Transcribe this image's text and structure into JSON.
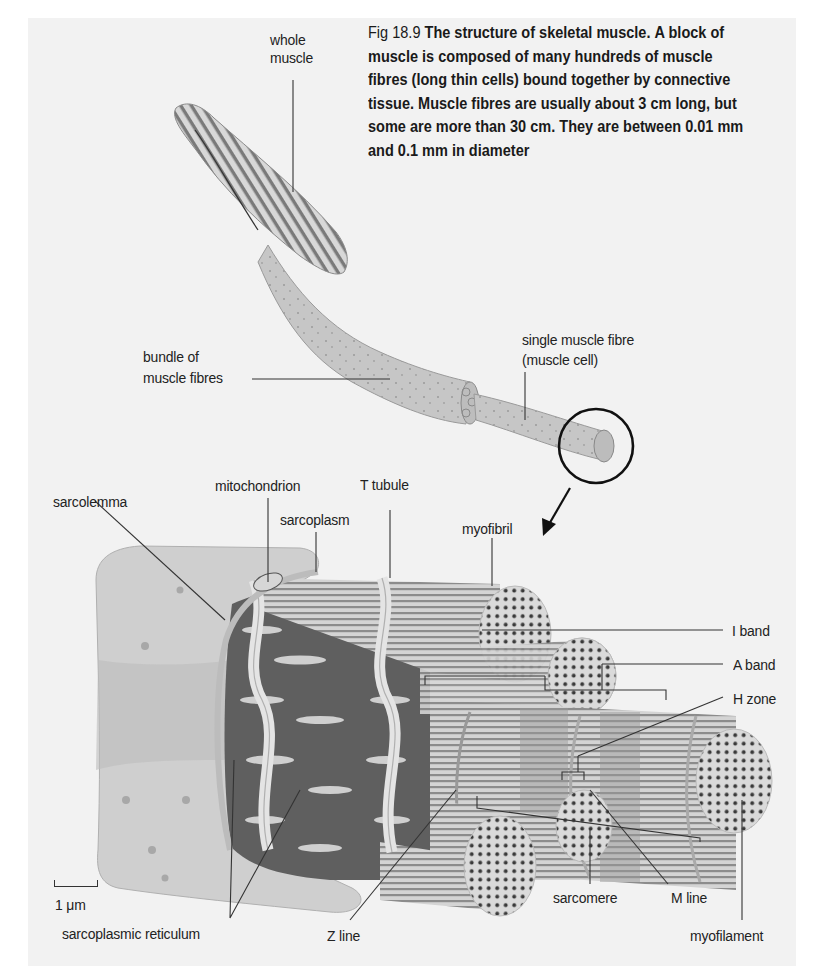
{
  "caption": {
    "figure_number": "Fig 18.9",
    "title": "The structure of skeletal muscle.",
    "body": "A block of muscle is composed of many hundreds of muscle fibres (long thin cells) bound together by connective tissue. Muscle fibres are usually about 3 cm long, but some are more than 30 cm. They are between 0.01 mm and 0.1 mm in diameter"
  },
  "labels": {
    "whole_muscle_line1": "whole",
    "whole_muscle_line2": "muscle",
    "bundle_line1": "bundle of",
    "bundle_line2": "muscle fibres",
    "single_fibre_line1": "single muscle fibre",
    "single_fibre_line2": "(muscle cell)",
    "sarcolemma": "sarcolemma",
    "mitochondrion": "mitochondrion",
    "t_tubule": "T tubule",
    "sarcoplasm": "sarcoplasm",
    "myofibril": "myofibril",
    "i_band": "I band",
    "a_band": "A band",
    "h_zone": "H zone",
    "sarcoplasmic_reticulum": "sarcoplasmic reticulum",
    "z_line": "Z line",
    "sarcomere": "sarcomere",
    "m_line": "M line",
    "myofilament": "myofilament"
  },
  "scale_bar": {
    "label": "1 μm"
  },
  "colors": {
    "panel_background": "#f2f2f2",
    "tissue_light": "#c8c8c8",
    "tissue_mid": "#a8a8a8",
    "reticulum_dark": "#5f5f5f",
    "leader_line": "#333333"
  }
}
